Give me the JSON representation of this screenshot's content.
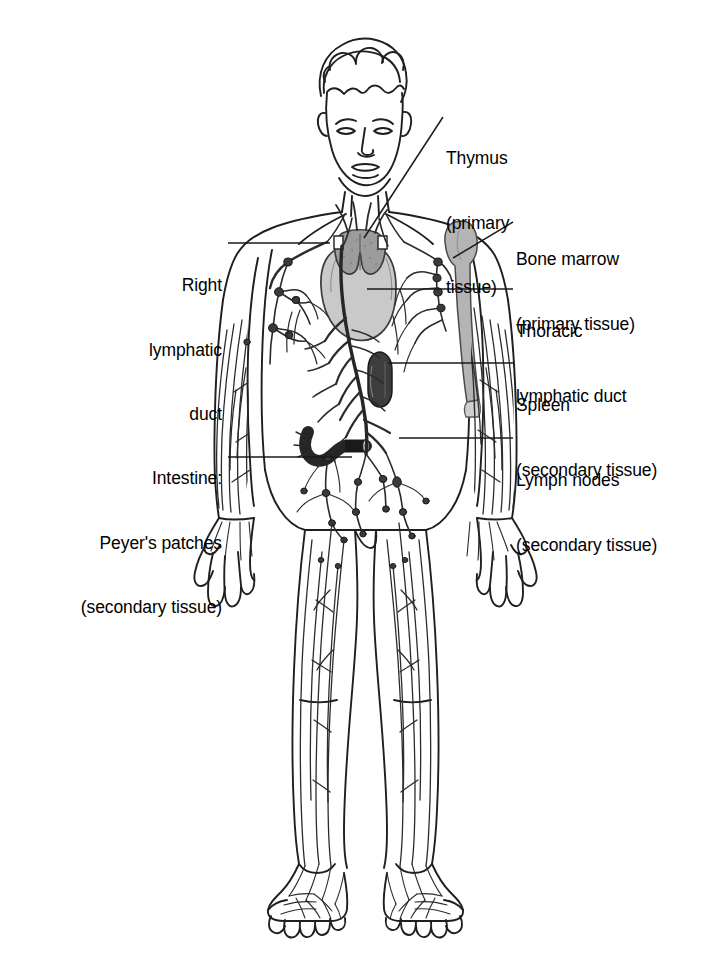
{
  "figure": {
    "background_color": "#ffffff",
    "ink_color": "#1a1a1a"
  },
  "labels": {
    "thymus": {
      "lines": [
        "Thymus",
        "(primary",
        "tissue)"
      ],
      "side": "right",
      "leader": "diagonal"
    },
    "bone_marrow": {
      "lines": [
        "Bone marrow",
        "(primary tissue)"
      ],
      "side": "right",
      "leader": "diagonal"
    },
    "thoracic_duct": {
      "lines": [
        "Thoracic",
        "lymphatic duct"
      ],
      "side": "right",
      "leader": "horizontal"
    },
    "spleen": {
      "lines": [
        "Spleen",
        "(secondary tissue)"
      ],
      "side": "right",
      "leader": "horizontal"
    },
    "lymph_nodes": {
      "lines": [
        "Lymph nodes",
        "(secondary tissue)"
      ],
      "side": "right",
      "leader": "horizontal"
    },
    "right_lymphatic_duct": {
      "lines": [
        "Right",
        "lymphatic",
        "duct"
      ],
      "side": "left",
      "leader": "horizontal"
    },
    "intestine": {
      "lines": [
        "Intestine:",
        "Peyer's patches",
        "(secondary tissue)"
      ],
      "side": "left",
      "leader": "horizontal"
    }
  },
  "organs": {
    "thymus": {
      "name": "thymus",
      "fill": "#9c9c9c",
      "tissue_class": "primary"
    },
    "heart": {
      "name": "heart",
      "fill": "#c9c9c9",
      "tissue_class": "none"
    },
    "bone_marrow": {
      "name": "humerus-bone-marrow",
      "fill": "#b4b4b4",
      "tissue_class": "primary"
    },
    "spleen": {
      "name": "spleen",
      "fill": "#3d3d3d",
      "tissue_class": "secondary"
    },
    "intestine": {
      "name": "intestine-peyers-patches",
      "fill": "#262626",
      "tissue_class": "secondary"
    },
    "lymph_node": {
      "name": "lymph-node",
      "fill": "#3a3a3a",
      "tissue_class": "secondary"
    },
    "lymph_vessel": {
      "name": "lymphatic-vessel",
      "stroke": "#2b2b2b"
    },
    "thoracic_duct": {
      "name": "thoracic-lymphatic-duct",
      "stroke": "#262626"
    }
  }
}
